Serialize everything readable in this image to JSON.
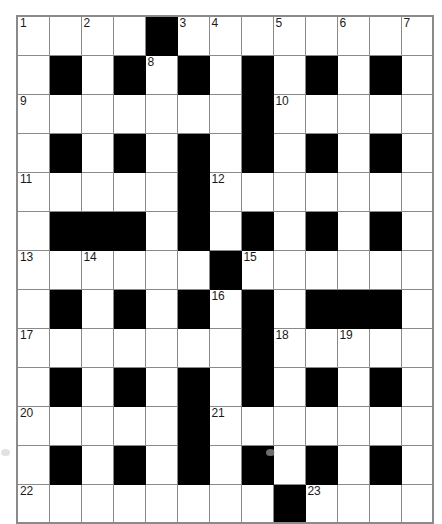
{
  "puzzle": {
    "title": "Crossword grid",
    "columns": 13,
    "rows": 11,
    "cell_px": 32,
    "colors": {
      "block": "#000000",
      "grid_line": "#8a8a8a",
      "background": "#ffffff",
      "number_text": "#1a1a1a"
    },
    "numbers_present": [
      1,
      2,
      3,
      4,
      5,
      6,
      7,
      8,
      9,
      10,
      11,
      12,
      13,
      14,
      15,
      16,
      17,
      18,
      19,
      20,
      21,
      22,
      23
    ],
    "grid": [
      [
        {
          "type": "open",
          "number": "1"
        },
        {
          "type": "open",
          "number": ""
        },
        {
          "type": "open",
          "number": "2"
        },
        {
          "type": "open",
          "number": ""
        },
        {
          "type": "block",
          "number": ""
        },
        {
          "type": "open",
          "number": "3"
        },
        {
          "type": "open",
          "number": "4"
        },
        {
          "type": "open",
          "number": ""
        },
        {
          "type": "open",
          "number": "5"
        },
        {
          "type": "open",
          "number": ""
        },
        {
          "type": "open",
          "number": "6"
        },
        {
          "type": "open",
          "number": ""
        },
        {
          "type": "open",
          "number": "7"
        }
      ],
      [
        {
          "type": "open",
          "number": ""
        },
        {
          "type": "block",
          "number": ""
        },
        {
          "type": "open",
          "number": ""
        },
        {
          "type": "block",
          "number": ""
        },
        {
          "type": "open",
          "number": "8"
        },
        {
          "type": "block",
          "number": ""
        },
        {
          "type": "open",
          "number": ""
        },
        {
          "type": "block",
          "number": ""
        },
        {
          "type": "open",
          "number": ""
        },
        {
          "type": "block",
          "number": ""
        },
        {
          "type": "open",
          "number": ""
        },
        {
          "type": "block",
          "number": ""
        },
        {
          "type": "open",
          "number": ""
        }
      ],
      [
        {
          "type": "open",
          "number": "9"
        },
        {
          "type": "open",
          "number": ""
        },
        {
          "type": "open",
          "number": ""
        },
        {
          "type": "open",
          "number": ""
        },
        {
          "type": "open",
          "number": ""
        },
        {
          "type": "open",
          "number": ""
        },
        {
          "type": "open",
          "number": ""
        },
        {
          "type": "block",
          "number": ""
        },
        {
          "type": "open",
          "number": "10"
        },
        {
          "type": "open",
          "number": ""
        },
        {
          "type": "open",
          "number": ""
        },
        {
          "type": "open",
          "number": ""
        },
        {
          "type": "open",
          "number": ""
        }
      ],
      [
        {
          "type": "open",
          "number": ""
        },
        {
          "type": "block",
          "number": ""
        },
        {
          "type": "open",
          "number": ""
        },
        {
          "type": "block",
          "number": ""
        },
        {
          "type": "open",
          "number": ""
        },
        {
          "type": "block",
          "number": ""
        },
        {
          "type": "open",
          "number": ""
        },
        {
          "type": "block",
          "number": ""
        },
        {
          "type": "open",
          "number": ""
        },
        {
          "type": "block",
          "number": ""
        },
        {
          "type": "open",
          "number": ""
        },
        {
          "type": "block",
          "number": ""
        },
        {
          "type": "open",
          "number": ""
        }
      ],
      [
        {
          "type": "open",
          "number": "11"
        },
        {
          "type": "open",
          "number": ""
        },
        {
          "type": "open",
          "number": ""
        },
        {
          "type": "open",
          "number": ""
        },
        {
          "type": "open",
          "number": ""
        },
        {
          "type": "block",
          "number": ""
        },
        {
          "type": "open",
          "number": "12"
        },
        {
          "type": "open",
          "number": ""
        },
        {
          "type": "open",
          "number": ""
        },
        {
          "type": "open",
          "number": ""
        },
        {
          "type": "open",
          "number": ""
        },
        {
          "type": "open",
          "number": ""
        },
        {
          "type": "open",
          "number": ""
        }
      ],
      [
        {
          "type": "open",
          "number": ""
        },
        {
          "type": "block",
          "number": ""
        },
        {
          "type": "block",
          "number": ""
        },
        {
          "type": "block",
          "number": ""
        },
        {
          "type": "open",
          "number": ""
        },
        {
          "type": "block",
          "number": ""
        },
        {
          "type": "open",
          "number": ""
        },
        {
          "type": "block",
          "number": ""
        },
        {
          "type": "open",
          "number": ""
        },
        {
          "type": "block",
          "number": ""
        },
        {
          "type": "open",
          "number": ""
        },
        {
          "type": "block",
          "number": ""
        },
        {
          "type": "open",
          "number": ""
        }
      ],
      [
        {
          "type": "open",
          "number": "13"
        },
        {
          "type": "open",
          "number": ""
        },
        {
          "type": "open",
          "number": "14"
        },
        {
          "type": "open",
          "number": ""
        },
        {
          "type": "open",
          "number": ""
        },
        {
          "type": "open",
          "number": ""
        },
        {
          "type": "block",
          "number": ""
        },
        {
          "type": "open",
          "number": "15"
        },
        {
          "type": "open",
          "number": ""
        },
        {
          "type": "open",
          "number": ""
        },
        {
          "type": "open",
          "number": ""
        },
        {
          "type": "open",
          "number": ""
        },
        {
          "type": "open",
          "number": ""
        }
      ],
      [
        {
          "type": "open",
          "number": ""
        },
        {
          "type": "block",
          "number": ""
        },
        {
          "type": "open",
          "number": ""
        },
        {
          "type": "block",
          "number": ""
        },
        {
          "type": "open",
          "number": ""
        },
        {
          "type": "block",
          "number": ""
        },
        {
          "type": "open",
          "number": "16"
        },
        {
          "type": "block",
          "number": ""
        },
        {
          "type": "open",
          "number": ""
        },
        {
          "type": "block",
          "number": ""
        },
        {
          "type": "block",
          "number": ""
        },
        {
          "type": "block",
          "number": ""
        },
        {
          "type": "open",
          "number": ""
        }
      ],
      [
        {
          "type": "open",
          "number": "17"
        },
        {
          "type": "open",
          "number": ""
        },
        {
          "type": "open",
          "number": ""
        },
        {
          "type": "open",
          "number": ""
        },
        {
          "type": "open",
          "number": ""
        },
        {
          "type": "open",
          "number": ""
        },
        {
          "type": "open",
          "number": ""
        },
        {
          "type": "block",
          "number": ""
        },
        {
          "type": "open",
          "number": "18"
        },
        {
          "type": "open",
          "number": ""
        },
        {
          "type": "open",
          "number": "19"
        },
        {
          "type": "open",
          "number": ""
        },
        {
          "type": "open",
          "number": ""
        }
      ],
      [
        {
          "type": "open",
          "number": ""
        },
        {
          "type": "block",
          "number": ""
        },
        {
          "type": "open",
          "number": ""
        },
        {
          "type": "block",
          "number": ""
        },
        {
          "type": "open",
          "number": ""
        },
        {
          "type": "block",
          "number": ""
        },
        {
          "type": "open",
          "number": ""
        },
        {
          "type": "block",
          "number": ""
        },
        {
          "type": "open",
          "number": ""
        },
        {
          "type": "block",
          "number": ""
        },
        {
          "type": "open",
          "number": ""
        },
        {
          "type": "block",
          "number": ""
        },
        {
          "type": "open",
          "number": ""
        }
      ],
      [
        {
          "type": "open",
          "number": "20"
        },
        {
          "type": "open",
          "number": ""
        },
        {
          "type": "open",
          "number": ""
        },
        {
          "type": "open",
          "number": ""
        },
        {
          "type": "open",
          "number": ""
        },
        {
          "type": "block",
          "number": ""
        },
        {
          "type": "open",
          "number": "21"
        },
        {
          "type": "open",
          "number": ""
        },
        {
          "type": "open",
          "number": ""
        },
        {
          "type": "open",
          "number": ""
        },
        {
          "type": "open",
          "number": ""
        },
        {
          "type": "open",
          "number": ""
        },
        {
          "type": "open",
          "number": ""
        }
      ],
      [
        {
          "type": "open",
          "number": ""
        },
        {
          "type": "block",
          "number": ""
        },
        {
          "type": "open",
          "number": ""
        },
        {
          "type": "block",
          "number": ""
        },
        {
          "type": "open",
          "number": ""
        },
        {
          "type": "block",
          "number": ""
        },
        {
          "type": "open",
          "number": ""
        },
        {
          "type": "block",
          "number": ""
        },
        {
          "type": "open",
          "number": ""
        },
        {
          "type": "block",
          "number": ""
        },
        {
          "type": "open",
          "number": ""
        },
        {
          "type": "block",
          "number": ""
        },
        {
          "type": "open",
          "number": ""
        }
      ],
      [
        {
          "type": "open",
          "number": "22"
        },
        {
          "type": "open",
          "number": ""
        },
        {
          "type": "open",
          "number": ""
        },
        {
          "type": "open",
          "number": ""
        },
        {
          "type": "open",
          "number": ""
        },
        {
          "type": "open",
          "number": ""
        },
        {
          "type": "open",
          "number": ""
        },
        {
          "type": "open",
          "number": ""
        },
        {
          "type": "block",
          "number": ""
        },
        {
          "type": "open",
          "number": "23"
        },
        {
          "type": "open",
          "number": ""
        },
        {
          "type": "open",
          "number": ""
        },
        {
          "type": "open",
          "number": ""
        }
      ]
    ]
  }
}
